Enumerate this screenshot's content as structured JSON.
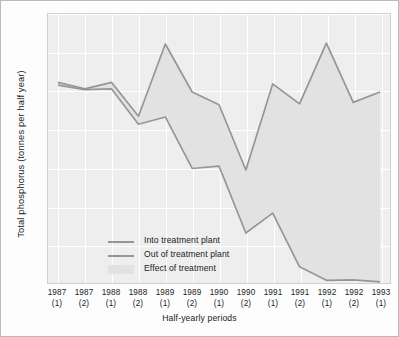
{
  "chart_data": {
    "type": "line",
    "title": "",
    "xlabel": "Half-yearly periods",
    "ylabel": "Total phosphorus (tonnes per half year)",
    "categories": [
      "1987\n(1)",
      "1987\n(2)",
      "1988\n(1)",
      "1988\n(2)",
      "1989\n(1)",
      "1989\n(2)",
      "1990\n(1)",
      "1990\n(2)",
      "1991\n(1)",
      "1991\n(2)",
      "1992\n(1)",
      "1992\n(2)",
      "1993\n(1)"
    ],
    "category_years": [
      "1987",
      "1987",
      "1988",
      "1988",
      "1989",
      "1989",
      "1990",
      "1990",
      "1991",
      "1991",
      "1992",
      "1992",
      "1993"
    ],
    "category_halves": [
      "(1)",
      "(2)",
      "(1)",
      "(2)",
      "(1)",
      "(2)",
      "(1)",
      "(2)",
      "(1)",
      "(2)",
      "(1)",
      "(2)",
      "(1)"
    ],
    "series": [
      {
        "name": "Into treatment plant",
        "color": "#969696",
        "values": [
          522,
          505,
          522,
          434,
          622,
          497,
          464,
          294,
          518,
          466,
          624,
          470,
          497
        ]
      },
      {
        "name": "Out of treatment plant",
        "color": "#969696",
        "values": [
          515,
          503,
          505,
          413,
          432,
          298,
          304,
          130,
          182,
          42,
          7,
          8,
          3
        ]
      }
    ],
    "fill_between": {
      "name": "Effect of treatment",
      "color": "#e2e2e2"
    },
    "ylim": [
      0,
      700
    ],
    "yticks": [
      0,
      100,
      200,
      300,
      400,
      500,
      600,
      700
    ],
    "ytick_labels": [
      "0",
      "100",
      "200",
      "300",
      "400",
      "500",
      "600",
      "700"
    ],
    "grid": true,
    "grid_color": "#ffffff",
    "plot_background": "#eeeeee",
    "legend_position": "inside-lower-left"
  },
  "legend": {
    "items": [
      {
        "label": "Into treatment plant",
        "marker": "line"
      },
      {
        "label": "Out of treatment plant",
        "marker": "line"
      },
      {
        "label": "Effect of treatment",
        "marker": "area"
      }
    ]
  }
}
